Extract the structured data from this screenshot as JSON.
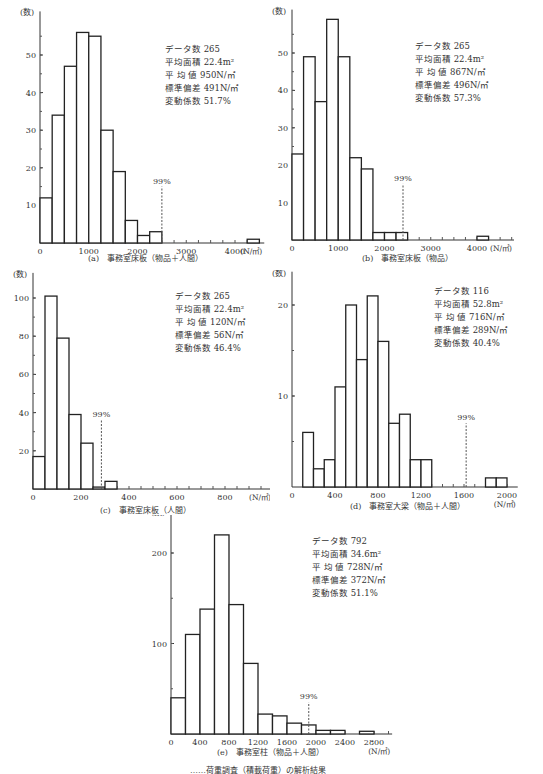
{
  "chart_data": [
    {
      "id": "a",
      "type": "bar",
      "title": "(a)　事務室床板（物品＋人間）",
      "xlabel": "(N/㎡)",
      "ylabel": "(数)",
      "bin_width": 250,
      "bins": [
        [
          0,
          12
        ],
        [
          250,
          34
        ],
        [
          500,
          47
        ],
        [
          750,
          56
        ],
        [
          1000,
          55
        ],
        [
          1250,
          30
        ],
        [
          1500,
          19
        ],
        [
          1750,
          6
        ],
        [
          2000,
          2
        ],
        [
          2250,
          3
        ],
        [
          4250,
          1
        ]
      ],
      "xticks": [
        "0",
        "1000",
        "2000",
        "3000",
        "4000"
      ],
      "xtick_values": [
        0,
        1000,
        2000,
        3000,
        4000
      ],
      "yticks": [
        "10",
        "20",
        "30",
        "40",
        "50"
      ],
      "ytick_values": [
        10,
        20,
        30,
        40,
        50
      ],
      "xlim": [
        0,
        4600
      ],
      "ylim": [
        0,
        60
      ],
      "percentile_label": "99%",
      "percentile_x": 2500,
      "stats": {
        "count": "データ数 265",
        "area": "平均面積 22.4m²",
        "mean": "平 均 値 950N/㎡",
        "std": "標準偏差 491N/㎡",
        "cv": "変動係数 51.7%"
      }
    },
    {
      "id": "b",
      "type": "bar",
      "title": "(b)　事務室床板（物品）",
      "xlabel": "(N/㎡)",
      "ylabel": "(数)",
      "bin_width": 250,
      "bins": [
        [
          0,
          23
        ],
        [
          250,
          49
        ],
        [
          500,
          37
        ],
        [
          750,
          59
        ],
        [
          1000,
          49
        ],
        [
          1250,
          22
        ],
        [
          1500,
          19
        ],
        [
          1750,
          2
        ],
        [
          2000,
          2
        ],
        [
          2250,
          2
        ],
        [
          4000,
          1
        ]
      ],
      "xticks": [
        "0",
        "1000",
        "2000",
        "3000",
        "4000"
      ],
      "xtick_values": [
        0,
        1000,
        2000,
        3000,
        4000
      ],
      "yticks": [
        "10",
        "20",
        "30",
        "40",
        "50"
      ],
      "ytick_values": [
        10,
        20,
        30,
        40,
        50
      ],
      "xlim": [
        0,
        4800
      ],
      "ylim": [
        0,
        60
      ],
      "percentile_label": "99%",
      "percentile_x": 2400,
      "stats": {
        "count": "データ数 265",
        "area": "平均面積 22.4m²",
        "mean": "平 均 値 867N/㎡",
        "std": "標準偏差 496N/㎡",
        "cv": "変動係数 57.3%"
      }
    },
    {
      "id": "c",
      "type": "bar",
      "title": "(c)　事務室床板（人間）",
      "xlabel": "(N/㎡)",
      "ylabel": "(数)",
      "bin_width": 50,
      "bins": [
        [
          0,
          17
        ],
        [
          50,
          101
        ],
        [
          100,
          79
        ],
        [
          150,
          39
        ],
        [
          200,
          24
        ],
        [
          250,
          1
        ],
        [
          300,
          4
        ]
      ],
      "xticks": [
        "0",
        "200",
        "400",
        "600",
        "800"
      ],
      "xtick_values": [
        0,
        200,
        400,
        600,
        800
      ],
      "yticks": [
        "20",
        "40",
        "60",
        "80",
        "100"
      ],
      "ytick_values": [
        20,
        40,
        60,
        80,
        100
      ],
      "xlim": [
        0,
        1000
      ],
      "ylim": [
        0,
        110
      ],
      "percentile_label": "99%",
      "percentile_x": 285,
      "stats": {
        "count": "データ数 265",
        "area": "平均面積 22.4m²",
        "mean": "平 均 値 120N/㎡",
        "std": "標準偏差 56N/㎡",
        "cv": "変動係数 46.4%"
      }
    },
    {
      "id": "d",
      "type": "bar",
      "title": "(d)　事務室大梁（物品＋人間）",
      "xlabel": "(N/㎡)",
      "ylabel": "(数)",
      "bin_width": 100,
      "bins": [
        [
          100,
          6
        ],
        [
          200,
          2
        ],
        [
          300,
          3
        ],
        [
          400,
          11
        ],
        [
          500,
          20
        ],
        [
          600,
          14
        ],
        [
          700,
          21
        ],
        [
          800,
          16
        ],
        [
          900,
          7
        ],
        [
          1000,
          8
        ],
        [
          1100,
          3
        ],
        [
          1200,
          3
        ],
        [
          1800,
          1
        ],
        [
          1900,
          1
        ]
      ],
      "xticks": [
        "0",
        "400",
        "800",
        "1200",
        "1600",
        "2000"
      ],
      "xtick_values": [
        0,
        400,
        800,
        1200,
        1600,
        2000
      ],
      "yticks": [
        "10",
        "20"
      ],
      "ytick_values": [
        10,
        20
      ],
      "xlim": [
        0,
        2100
      ],
      "ylim": [
        0,
        23
      ],
      "percentile_label": "99%",
      "percentile_x": 1620,
      "stats": {
        "count": "データ数 116",
        "area": "平均面積 52.8m²",
        "mean": "平 均 値 716N/㎡",
        "std": "標準偏差 289N/㎡",
        "cv": "変動係数 40.4%"
      }
    },
    {
      "id": "e",
      "type": "bar",
      "title": "(e)　事務室柱（物品＋人間）",
      "xlabel": "(N/㎡)",
      "ylabel": "(数)",
      "bin_width": 200,
      "bins": [
        [
          0,
          40
        ],
        [
          200,
          110
        ],
        [
          400,
          138
        ],
        [
          600,
          220
        ],
        [
          800,
          143
        ],
        [
          1000,
          78
        ],
        [
          1200,
          22
        ],
        [
          1400,
          20
        ],
        [
          1600,
          12
        ],
        [
          1800,
          10
        ],
        [
          2000,
          4
        ],
        [
          2200,
          4
        ],
        [
          2600,
          3
        ]
      ],
      "xticks": [
        "0",
        "400",
        "800",
        "1200",
        "1600",
        "2000",
        "2400",
        "2800"
      ],
      "xtick_values": [
        0,
        400,
        800,
        1200,
        1600,
        2000,
        2400,
        2800
      ],
      "yticks": [
        "100",
        "200"
      ],
      "ytick_values": [
        100,
        200
      ],
      "xlim": [
        0,
        3050
      ],
      "ylim": [
        0,
        240
      ],
      "percentile_label": "99%",
      "percentile_x": 1900,
      "stats": {
        "count": "データ数 792",
        "area": "平均面積 34.6m²",
        "mean": "平 均 値 728N/㎡",
        "std": "標準偏差 372N/㎡",
        "cv": "変動係数 51.1%"
      }
    }
  ],
  "figure_caption": "……荷重調査（積載荷重）の解析結果"
}
